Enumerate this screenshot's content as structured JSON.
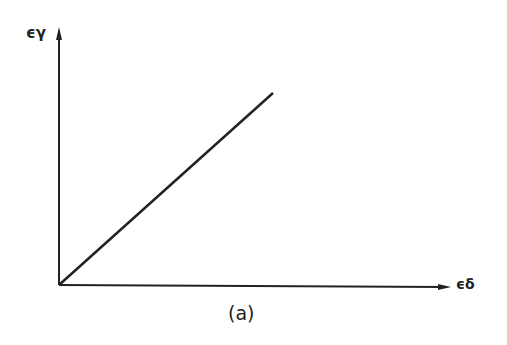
{
  "diagram": {
    "y_axis_label": "ϵγ",
    "x_axis_label": "ϵδ",
    "caption": "(a)",
    "line": {
      "type": "linear",
      "from": "origin",
      "description": "straight line through origin, positive slope"
    },
    "colors": {
      "ink": "#222222",
      "background": "#ffffff"
    }
  }
}
